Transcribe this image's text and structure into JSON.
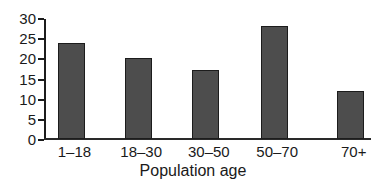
{
  "chart_data": {
    "type": "bar",
    "categories": [
      "1–18",
      "18–30",
      "30–50",
      "50–70",
      "70+"
    ],
    "values": [
      23.7,
      20,
      17,
      28,
      12
    ],
    "title": "",
    "xlabel": "Population age",
    "ylabel": "",
    "ylim": [
      0,
      30
    ],
    "yticks": [
      0,
      5,
      10,
      15,
      20,
      25,
      30
    ],
    "grid": false,
    "legend": "none",
    "bar_fill": "#4d4d4d",
    "bar_stroke": "#1c1c1c",
    "axis_color": "#1c1c1c",
    "text_color": "#1a1a1a",
    "background": "#ffffff"
  }
}
